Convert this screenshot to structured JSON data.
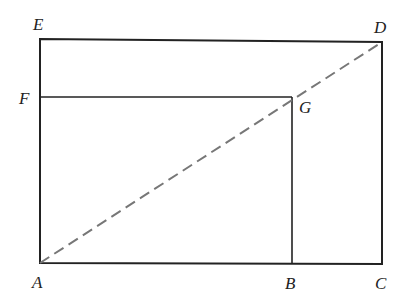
{
  "diagram": {
    "title": "",
    "points": {
      "A": {
        "label": "A",
        "x": 40,
        "y": 263
      },
      "B": {
        "label": "B",
        "x": 292,
        "y": 264
      },
      "C": {
        "label": "C",
        "x": 382,
        "y": 264
      },
      "D": {
        "label": "D",
        "x": 382,
        "y": 42
      },
      "E": {
        "label": "E",
        "x": 40,
        "y": 39
      },
      "F": {
        "label": "F",
        "x": 40,
        "y": 97
      },
      "G": {
        "label": "G",
        "x": 292,
        "y": 97
      }
    },
    "segments": [
      {
        "from": "A",
        "to": "C",
        "style": "solid"
      },
      {
        "from": "C",
        "to": "D",
        "style": "solid"
      },
      {
        "from": "D",
        "to": "E",
        "style": "solid"
      },
      {
        "from": "E",
        "to": "A",
        "style": "solid"
      },
      {
        "from": "F",
        "to": "G",
        "style": "solid"
      },
      {
        "from": "G",
        "to": "B",
        "style": "solid"
      },
      {
        "from": "A",
        "to": "D",
        "style": "dashed"
      }
    ],
    "colors": {
      "line": "#222222",
      "dashed": "#777777"
    }
  }
}
